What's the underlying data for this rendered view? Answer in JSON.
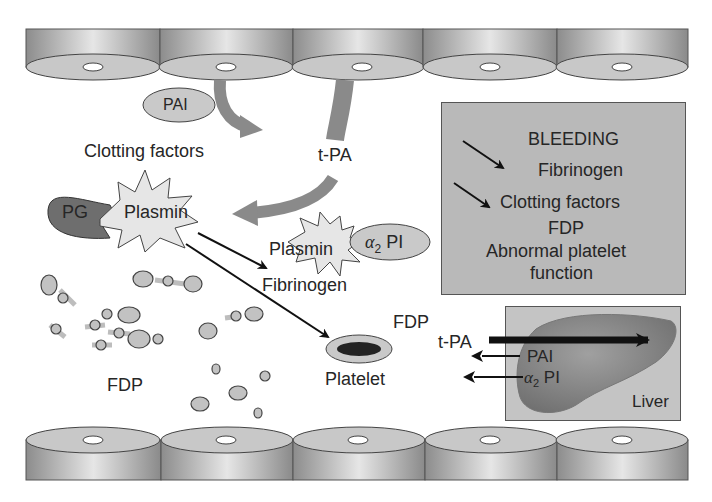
{
  "diagram": {
    "type": "biological-pathway"
  },
  "labels": {
    "pai_top": "PAI",
    "clotting_factors": "Clotting factors",
    "tpa_top": "t-PA",
    "pg": "PG",
    "plasmin_main": "Plasmin",
    "plasmin_complex": "Plasmin",
    "alpha2_pi_symbol": "α",
    "alpha2_pi_sub": "2",
    "alpha2_pi_text": "PI",
    "fibrinogen": "Fibrinogen",
    "fdp_left": "FDP",
    "platelet": "Platelet",
    "fdp_right": "FDP",
    "tpa_liver": "t-PA",
    "pai_liver": "PAI",
    "alpha2_pi_liver_symbol": "α",
    "alpha2_pi_liver_sub": "2",
    "alpha2_pi_liver_text": "PI",
    "liver": "Liver"
  },
  "bleeding_box": {
    "title": "BLEEDING",
    "items": [
      {
        "text": "Fibrinogen",
        "arrow": "decrease"
      },
      {
        "text": "Clotting factors",
        "arrow": "decrease"
      },
      {
        "text": "FDP",
        "arrow": "none"
      },
      {
        "text": "Abnormal platelet",
        "arrow": "none"
      },
      {
        "text": "function",
        "arrow": "none"
      }
    ]
  },
  "endothelium": {
    "top_cells": 5,
    "bottom_cells": 5
  },
  "colors": {
    "cell_side": "#a8a8a8",
    "cell_top": "#c8c8c8",
    "arrow_gray": "#8a8a8a",
    "pg_dark": "#6e6e6e",
    "box_fill": "#b9b9b9",
    "ellipse_fill": "#c9c9c9"
  }
}
